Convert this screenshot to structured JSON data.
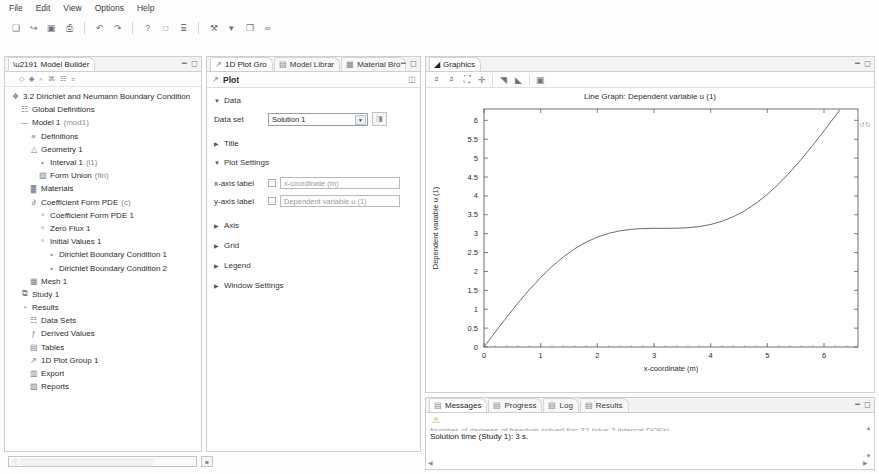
{
  "menubar": {
    "items": [
      {
        "label": "File"
      },
      {
        "label": "Edit"
      },
      {
        "label": "View"
      },
      {
        "label": "Options"
      },
      {
        "label": "Help"
      }
    ]
  },
  "toolbar": {
    "buttons": [
      {
        "name": "new-icon",
        "glyph": "❑"
      },
      {
        "name": "open-icon",
        "glyph": "↪"
      },
      {
        "name": "save-icon",
        "glyph": "▣"
      },
      {
        "name": "print-icon",
        "glyph": "⎙"
      },
      {
        "name": "undo-icon",
        "glyph": "↶"
      },
      {
        "name": "redo-icon",
        "glyph": "↷"
      },
      {
        "name": "help-icon",
        "glyph": "?"
      },
      {
        "name": "window-icon",
        "glyph": "□"
      },
      {
        "name": "desktop-icon",
        "glyph": "⌸"
      },
      {
        "name": "build-icon",
        "glyph": "⚒"
      },
      {
        "name": "dropdown-icon",
        "glyph": "▾"
      },
      {
        "name": "layout-icon",
        "glyph": "❐"
      },
      {
        "name": "compute-icon",
        "glyph": "∞"
      }
    ]
  },
  "model_builder": {
    "tab_label": "Model Builder",
    "toolbar_icons": [
      "collapse-icon",
      "expand-icon",
      "show-icon",
      "hide-icon",
      "tree-icon",
      "filter-icon"
    ],
    "tree": [
      {
        "label": "3.2 Dirichlet and Neumann Boundary Condition",
        "icon": "❖",
        "indent": 0
      },
      {
        "label": "Global Definitions",
        "icon": "☷",
        "indent": 1
      },
      {
        "label": "Model 1 ",
        "suffix": "(mod1)",
        "icon": "—",
        "indent": 1
      },
      {
        "label": "Definitions",
        "icon": "≡",
        "indent": 2
      },
      {
        "label": "Geometry 1",
        "icon": "△",
        "indent": 2
      },
      {
        "label": "Interval 1 ",
        "suffix": "(i1)",
        "icon": "•",
        "indent": 3
      },
      {
        "label": "Form Union ",
        "suffix": "(fin)",
        "icon": "▨",
        "indent": 3
      },
      {
        "label": "Materials",
        "icon": "▓",
        "indent": 2
      },
      {
        "label": "Coefficient Form PDE ",
        "suffix": "(c)",
        "icon": "∂",
        "indent": 2
      },
      {
        "label": "Coefficient Form PDE 1",
        "icon": "ⁿ",
        "indent": 3
      },
      {
        "label": "Zero Flux 1",
        "icon": "ⁿ",
        "indent": 3
      },
      {
        "label": "Initial Values 1",
        "icon": "ⁿ",
        "indent": 3
      },
      {
        "label": "Dirichlet Boundary Condition 1",
        "icon": "•",
        "indent": 4
      },
      {
        "label": "Dirichlet Boundary Condition 2",
        "icon": "•",
        "indent": 4
      },
      {
        "label": "Mesh 1",
        "icon": "▦",
        "indent": 2
      },
      {
        "label": "Study 1",
        "icon": "⧉",
        "indent": 1
      },
      {
        "label": "Results",
        "icon": "◔",
        "indent": 1
      },
      {
        "label": "Data Sets",
        "icon": "☷",
        "indent": 2
      },
      {
        "label": "Derived Values",
        "icon": "ƒ",
        "indent": 2
      },
      {
        "label": "Tables",
        "icon": "▤",
        "indent": 2
      },
      {
        "label": "1D Plot Group 1",
        "icon": "↗",
        "indent": 2
      },
      {
        "label": "Export",
        "icon": "▥",
        "indent": 2
      },
      {
        "label": "Reports",
        "icon": "▧",
        "indent": 2
      }
    ]
  },
  "settings": {
    "tabs": [
      {
        "label": "1D Plot Gro",
        "icon": "plot-icon",
        "active": true
      },
      {
        "label": "Model Librar",
        "icon": "library-icon",
        "active": false
      },
      {
        "label": "Material Bro",
        "icon": "material-icon",
        "active": false
      }
    ],
    "header": "Plot",
    "sections": {
      "data": {
        "label": "Data",
        "expanded": true
      },
      "title": {
        "label": "Title",
        "expanded": false
      },
      "plot_settings": {
        "label": "Plot Settings",
        "expanded": true
      },
      "axis": {
        "label": "Axis",
        "expanded": false
      },
      "grid": {
        "label": "Grid",
        "expanded": false
      },
      "legend": {
        "label": "Legend",
        "expanded": false
      },
      "window_settings": {
        "label": "Window Settings",
        "expanded": false
      }
    },
    "data_set": {
      "label": "Data set",
      "value": "Solution 1"
    },
    "x_axis_label": {
      "label": "x-axis label",
      "value": "x-coordinate (m)",
      "checked": false
    },
    "y_axis_label": {
      "label": "y-axis label",
      "value": "Dependent variable u (1)",
      "checked": false
    }
  },
  "graphics": {
    "tab_label": "Graphics",
    "toolbar_icons": [
      "zoom-in-icon",
      "zoom-out-icon",
      "zoom-extents-icon",
      "zoom-box-icon",
      "scene-light-icon",
      "transparency-icon",
      "image-snapshot-icon"
    ],
    "hint": "↺↻"
  },
  "chart_data": {
    "type": "line",
    "title": "Line Graph: Dependent variable u (1)",
    "xlabel": "x-coordinate (m)",
    "ylabel": "Dependent variable u (1)",
    "xlim": [
      0,
      6.6
    ],
    "ylim": [
      0,
      6.3
    ],
    "xticks": [
      0,
      1,
      2,
      3,
      4,
      5,
      6
    ],
    "yticks": [
      0,
      0.5,
      1,
      1.5,
      2,
      2.5,
      3,
      3.5,
      4,
      4.5,
      5,
      5.5,
      6
    ],
    "grid": false,
    "legend": false,
    "line_color": "#5a5a5a",
    "series": [
      {
        "name": "u",
        "x": [
          0,
          0.2,
          0.4,
          0.6,
          0.8,
          1.0,
          1.2,
          1.4,
          1.6,
          1.8,
          2.0,
          2.2,
          2.4,
          2.6,
          2.8,
          3.0,
          3.2,
          3.4,
          3.6,
          3.8,
          4.0,
          4.2,
          4.4,
          4.6,
          4.8,
          5.0,
          5.2,
          5.4,
          5.6,
          5.8,
          6.0,
          6.2,
          6.283
        ],
        "y": [
          0,
          0.399,
          0.789,
          1.165,
          1.517,
          1.841,
          2.132,
          2.385,
          2.6,
          2.774,
          2.909,
          3.009,
          3.075,
          3.115,
          3.135,
          3.141,
          3.142,
          3.144,
          3.157,
          3.188,
          3.243,
          3.329,
          3.448,
          3.606,
          3.804,
          4.041,
          4.317,
          4.628,
          4.97,
          5.336,
          5.721,
          6.117,
          6.283
        ]
      }
    ]
  },
  "messages": {
    "tabs": [
      {
        "label": "Messages",
        "active": true
      },
      {
        "label": "Progress",
        "active": false
      },
      {
        "label": "Log",
        "active": false
      },
      {
        "label": "Results",
        "active": false
      }
    ],
    "lines": [
      "Number of degrees of freedom solved for: 32 (plus 2 internal DOFs).",
      "Solution time (Study 1): 3 s."
    ]
  },
  "statusbar": {
    "progress_text": "░░░░░░░░░░░░░░░░░░░░░░░░░░░░░",
    "stop_glyph": "■"
  }
}
